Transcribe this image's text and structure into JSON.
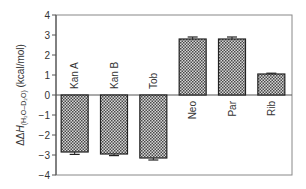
{
  "chart_data": {
    "type": "bar",
    "title": "",
    "xlabel": "",
    "ylabel": "ΔΔH(H2O–D2O) (kcal/mol)",
    "ylabel_parts": {
      "prefix": "ΔΔ",
      "italic": "H",
      "sub": "(H₂O–D₂O)",
      "unit": " (kcal/mol)"
    },
    "ylim": [
      -4,
      4
    ],
    "yticks": [
      -4,
      -3,
      -2,
      -1,
      0,
      1,
      2,
      3,
      4
    ],
    "ytick_labels": [
      "−4",
      "−3",
      "−2",
      "−1",
      "0",
      "1",
      "2",
      "3",
      "4"
    ],
    "categories": [
      "Kan A",
      "Kan B",
      "Tob",
      "Neo",
      "Par",
      "Rib"
    ],
    "values": [
      -2.85,
      -2.95,
      -3.15,
      2.8,
      2.8,
      1.05
    ],
    "errors": [
      0.12,
      0.08,
      0.1,
      0.1,
      0.1,
      0.04
    ],
    "grid": false,
    "legend": null,
    "bar_fill": "checkered gray",
    "colors": {
      "bar_dark": "#3a3a3a",
      "bar_light": "#d8d8d8",
      "axis": "#555555"
    }
  }
}
